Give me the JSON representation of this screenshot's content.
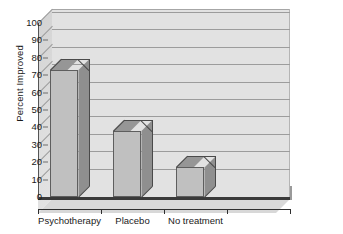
{
  "chart_data": {
    "type": "bar",
    "title": "",
    "subtitle": "",
    "xlabel": "",
    "ylabel": "Percent Improved",
    "categories": [
      "Psychotherapy",
      "Placebo",
      "No treatment",
      ""
    ],
    "values": [
      73,
      38,
      17,
      null
    ],
    "series": [
      {
        "name": "Percent Improved",
        "values": [
          73,
          38,
          17,
          null
        ]
      }
    ],
    "ylim": [
      0,
      100
    ],
    "ytick_labels": [
      "0",
      "10",
      "20",
      "30",
      "40",
      "50",
      "60",
      "70",
      "80",
      "90",
      "100"
    ],
    "ytick_values": [
      0,
      10,
      20,
      30,
      40,
      50,
      60,
      70,
      80,
      90,
      100
    ],
    "ytick_step": 10,
    "grid": true,
    "grid_axis": "y",
    "legend": false,
    "legend_position": "none",
    "style": "3d",
    "annotations": [],
    "colors": {
      "bar_front": "#c0c0c0",
      "bar_top": "#969696",
      "bar_side": "#8f8f8f",
      "bar_edge": "#5e5e5e",
      "plot_background": "#e2e2e2",
      "gridline": "#9c9c9c",
      "axis": "#2e2e2e",
      "floor": "#d8d8d8",
      "baseline": "#3a3a3a",
      "text": "#1a1a1a",
      "page_background": "#ffffff"
    }
  }
}
